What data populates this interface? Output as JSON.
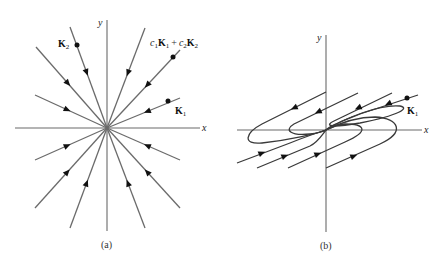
{
  "panels": [
    {
      "id": "a",
      "caption": "(a)",
      "type": "star-node",
      "axes": {
        "x_label": "x",
        "y_label": "y"
      },
      "flow_direction": "inward",
      "labels": {
        "k2": {
          "vec": "K",
          "sub": "2"
        },
        "k1": {
          "vec": "K",
          "sub": "1"
        },
        "combo": {
          "c1": "c",
          "c1_sub": "1",
          "k1": "K",
          "k1_sub": "1",
          "plus": "+",
          "c2": "c",
          "c2_sub": "2",
          "k2": "K",
          "k2_sub": "2"
        }
      }
    },
    {
      "id": "b",
      "caption": "(b)",
      "type": "degenerate-node",
      "axes": {
        "x_label": "x",
        "y_label": "y"
      },
      "flow_direction": "inward",
      "labels": {
        "k1": {
          "vec": "K",
          "sub": "1"
        }
      }
    }
  ],
  "colors": {
    "axis": "#6a6a6a",
    "trajectory_a": "#6b6b6b",
    "trajectory_b": "#3a3a3a",
    "marker": "#111111"
  }
}
